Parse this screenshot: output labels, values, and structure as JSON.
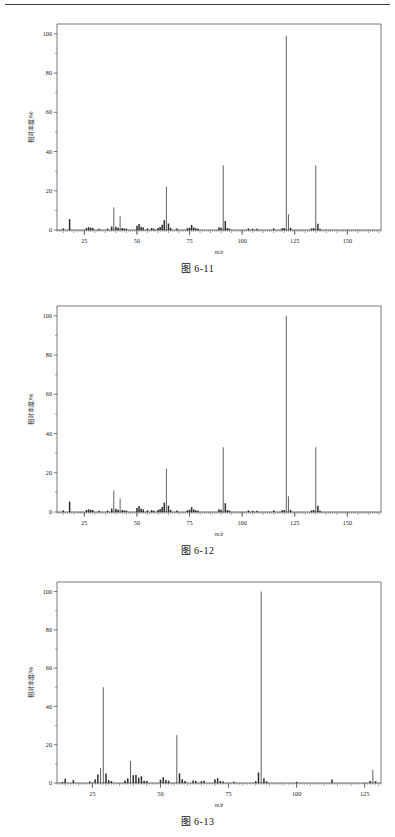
{
  "page": {
    "header_rule": true,
    "background": "#ffffff",
    "ink": "#2b2b2b"
  },
  "figures": [
    {
      "id": "fig-6-11",
      "caption": "图 6-11",
      "chart_data": {
        "type": "bar",
        "title": "",
        "xlabel": "m/z",
        "ylabel": "相对丰度/%",
        "xlim": [
          12,
          166
        ],
        "ylim": [
          0,
          105
        ],
        "xticks": [
          25,
          50,
          75,
          100,
          125,
          150
        ],
        "yticks": [
          0,
          20,
          40,
          60,
          80,
          100
        ],
        "grid": false,
        "legend": "none",
        "x": [
          15,
          18,
          26,
          27,
          28,
          29,
          32,
          36,
          38,
          39,
          40,
          41,
          42,
          43,
          44,
          45,
          50,
          51,
          52,
          53,
          55,
          57,
          58,
          60,
          61,
          62,
          63,
          64,
          65,
          66,
          69,
          74,
          75,
          76,
          77,
          78,
          79,
          89,
          90,
          91,
          92,
          93,
          94,
          103,
          105,
          107,
          115,
          119,
          120,
          121,
          122,
          123,
          133,
          134,
          135,
          136,
          137
        ],
        "values": [
          0.8,
          5.5,
          1.0,
          1.5,
          1.2,
          1.0,
          0.6,
          0.7,
          1.8,
          11.5,
          1.6,
          1.2,
          7.0,
          1.0,
          0.8,
          0.7,
          2.2,
          3.0,
          1.6,
          1.3,
          0.8,
          1.0,
          0.7,
          1.0,
          1.5,
          2.7,
          5.0,
          22.0,
          3.3,
          1.1,
          0.8,
          0.9,
          1.2,
          2.6,
          1.3,
          0.9,
          0.7,
          1.4,
          1.2,
          33.0,
          4.6,
          1.0,
          0.7,
          0.8,
          0.6,
          0.6,
          0.8,
          0.9,
          1.0,
          99.0,
          8.0,
          1.1,
          0.8,
          1.0,
          33.0,
          3.2,
          0.7
        ]
      }
    },
    {
      "id": "fig-6-12",
      "caption": "图 6-12",
      "chart_data": {
        "type": "bar",
        "title": "",
        "xlabel": "m/z",
        "ylabel": "相对丰度/%",
        "xlim": [
          12,
          166
        ],
        "ylim": [
          0,
          105
        ],
        "xticks": [
          25,
          50,
          75,
          100,
          125,
          150
        ],
        "yticks": [
          0,
          20,
          40,
          60,
          80,
          100
        ],
        "grid": false,
        "legend": "none",
        "x": [
          15,
          18,
          26,
          27,
          28,
          29,
          32,
          36,
          38,
          39,
          40,
          41,
          42,
          43,
          44,
          45,
          50,
          51,
          52,
          53,
          55,
          57,
          58,
          60,
          61,
          62,
          63,
          64,
          65,
          66,
          69,
          74,
          75,
          76,
          77,
          78,
          79,
          89,
          90,
          91,
          92,
          93,
          94,
          103,
          105,
          107,
          115,
          119,
          120,
          121,
          122,
          123,
          133,
          134,
          135,
          136,
          137
        ],
        "values": [
          0.8,
          5.3,
          1.0,
          1.4,
          1.2,
          1.0,
          0.6,
          0.7,
          1.8,
          11.0,
          1.6,
          1.2,
          6.8,
          1.0,
          0.8,
          0.7,
          2.1,
          3.0,
          1.6,
          1.3,
          0.8,
          1.0,
          0.7,
          1.0,
          1.5,
          2.6,
          4.8,
          22.0,
          3.2,
          1.1,
          0.8,
          0.9,
          1.2,
          2.5,
          1.3,
          0.9,
          0.7,
          1.4,
          1.2,
          33.0,
          4.5,
          1.0,
          0.7,
          0.8,
          0.6,
          0.6,
          0.8,
          0.9,
          1.0,
          100.0,
          8.0,
          1.1,
          0.8,
          1.0,
          33.0,
          3.2,
          0.7
        ]
      }
    },
    {
      "id": "fig-6-13",
      "caption": "图 6-13",
      "chart_data": {
        "type": "bar",
        "title": "",
        "xlabel": "m/z",
        "ylabel": "相对丰度/%",
        "xlim": [
          12,
          131
        ],
        "ylim": [
          0,
          105
        ],
        "xticks": [
          25,
          50,
          75,
          100,
          125
        ],
        "yticks": [
          0,
          20,
          40,
          60,
          80,
          100
        ],
        "grid": false,
        "legend": "none",
        "x": [
          14,
          15,
          18,
          24,
          26,
          27,
          28,
          29,
          30,
          31,
          32,
          37,
          38,
          39,
          40,
          41,
          42,
          43,
          44,
          45,
          50,
          51,
          52,
          53,
          56,
          57,
          58,
          59,
          62,
          63,
          65,
          66,
          70,
          71,
          72,
          73,
          77,
          85,
          86,
          87,
          88,
          89,
          100,
          113,
          127,
          128,
          129
        ],
        "values": [
          0.5,
          2.2,
          1.5,
          0.8,
          2.0,
          4.5,
          7.8,
          50.0,
          5.0,
          1.5,
          1.0,
          1.3,
          2.5,
          11.5,
          4.0,
          4.2,
          2.8,
          3.5,
          1.2,
          1.0,
          1.8,
          3.0,
          1.6,
          1.2,
          25.0,
          5.0,
          2.0,
          1.0,
          1.3,
          1.0,
          0.9,
          1.2,
          2.0,
          2.5,
          1.0,
          0.8,
          0.7,
          0.9,
          5.5,
          100.0,
          2.5,
          0.8,
          0.6,
          1.8,
          1.0,
          6.8,
          0.9
        ]
      }
    }
  ]
}
